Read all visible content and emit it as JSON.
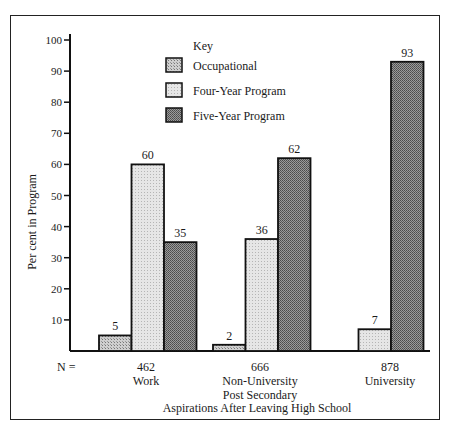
{
  "chart_data": {
    "type": "bar",
    "title": "",
    "xlabel": "Aspirations After Leaving High School",
    "ylabel": "Per cent in Program",
    "ylim": [
      0,
      100
    ],
    "yticks": [
      10,
      20,
      30,
      40,
      50,
      60,
      70,
      80,
      90,
      100
    ],
    "grid": false,
    "legend_title": "Key",
    "legend_position": "upper center",
    "categories": [
      "Work",
      "Non-University Post Secondary",
      "University"
    ],
    "category_lines": [
      [
        "Work"
      ],
      [
        "Non-University",
        "Post Secondary"
      ],
      [
        "University"
      ]
    ],
    "n_label": "N =",
    "n_values": [
      "462",
      "666",
      "878"
    ],
    "series": [
      {
        "name": "Occupational",
        "values": [
          5,
          2,
          null
        ],
        "labels": [
          "5",
          "2",
          ""
        ],
        "color": "#b8b8b8"
      },
      {
        "name": "Four-Year Program",
        "values": [
          60,
          36,
          7
        ],
        "labels": [
          "60",
          "36",
          "7"
        ],
        "color": "#dcdcdc"
      },
      {
        "name": "Five-Year Program",
        "values": [
          35,
          62,
          93
        ],
        "labels": [
          "35",
          "62",
          "93"
        ],
        "color": "#7a7a7a"
      }
    ]
  }
}
